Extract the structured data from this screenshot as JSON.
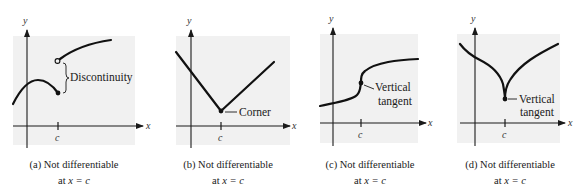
{
  "figure": {
    "axis_labels": {
      "x": "x",
      "y": "y",
      "tick": "c"
    },
    "panels": [
      {
        "id": "a",
        "annotation": "Discontinuity",
        "caption_line1": "(a) Not differentiable",
        "caption_line2_prefix": "at ",
        "caption_line2_math": "x = c"
      },
      {
        "id": "b",
        "annotation": "Corner",
        "caption_line1": "(b) Not differentiable",
        "caption_line2_prefix": "at ",
        "caption_line2_math": "x = c"
      },
      {
        "id": "c",
        "annotation_line1": "Vertical",
        "annotation_line2": "tangent",
        "caption_line1": "(c) Not differentiable",
        "caption_line2_prefix": "at ",
        "caption_line2_math": "x = c"
      },
      {
        "id": "d",
        "annotation_line1": "Vertical",
        "annotation_line2": "tangent",
        "caption_line1": "(d) Not differentiable",
        "caption_line2_prefix": "at ",
        "caption_line2_math": "x = c"
      }
    ],
    "colors": {
      "panel_background": "#f1f1f1",
      "ink": "#111111"
    }
  }
}
